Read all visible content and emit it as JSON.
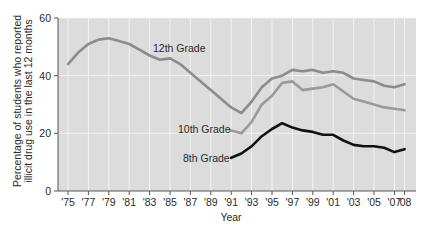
{
  "chart_data": {
    "type": "line",
    "title": "",
    "xlabel": "Year",
    "ylabel": "Percentage of students who reported illicit drug use in the last 12 months",
    "ylabel_lines": [
      "Percentage of students who reported",
      "illicit drug use in the last 12 months"
    ],
    "ylim": [
      0,
      60
    ],
    "yticks": [
      0,
      20,
      40,
      60
    ],
    "xlim": [
      1974,
      2008
    ],
    "xticks": [
      1975,
      1977,
      1979,
      1981,
      1983,
      1985,
      1987,
      1989,
      1991,
      1993,
      1995,
      1997,
      1999,
      2001,
      2003,
      2005,
      2007,
      2008
    ],
    "xtick_labels": [
      "'75",
      "'77",
      "'79",
      "'81",
      "'83",
      "'85",
      "'87",
      "'89",
      "'91",
      "'93",
      "'95",
      "'97",
      "'99",
      "'01",
      "'03",
      "'05",
      "'07",
      "'08"
    ],
    "grid": true,
    "legend": "inline labels",
    "series": [
      {
        "name": "12th Grade",
        "color": "#8c8c8c",
        "x": [
          1975,
          1976,
          1977,
          1978,
          1979,
          1980,
          1981,
          1982,
          1983,
          1984,
          1985,
          1986,
          1987,
          1988,
          1989,
          1990,
          1991,
          1992,
          1993,
          1994,
          1995,
          1996,
          1997,
          1998,
          1999,
          2000,
          2001,
          2002,
          2003,
          2004,
          2005,
          2006,
          2007,
          2008
        ],
        "values": [
          44,
          48,
          51,
          52.5,
          53,
          52,
          51,
          49,
          47,
          45.5,
          46,
          44,
          41,
          38,
          35,
          32,
          29,
          27,
          31,
          36,
          39,
          40,
          42,
          41.5,
          42,
          41,
          41.5,
          41,
          39,
          38.5,
          38,
          36.5,
          36,
          37
        ]
      },
      {
        "name": "10th Grade",
        "color": "#9a9a9a",
        "x": [
          1991,
          1992,
          1993,
          1994,
          1995,
          1996,
          1997,
          1998,
          1999,
          2000,
          2001,
          2002,
          2003,
          2004,
          2005,
          2006,
          2007,
          2008
        ],
        "values": [
          21,
          20,
          24,
          30,
          33,
          37.5,
          38,
          35,
          35.5,
          36,
          37,
          34.5,
          32,
          31,
          30,
          29,
          28.5,
          28
        ]
      },
      {
        "name": "8th Grade",
        "color": "#111111",
        "x": [
          1991,
          1992,
          1993,
          1994,
          1995,
          1996,
          1997,
          1998,
          1999,
          2000,
          2001,
          2002,
          2003,
          2004,
          2005,
          2006,
          2007,
          2008
        ],
        "values": [
          11.5,
          13,
          15.5,
          19,
          21.5,
          23.5,
          22,
          21,
          20.5,
          19.5,
          19.5,
          17.5,
          16,
          15.5,
          15.5,
          15,
          13.5,
          14.5
        ]
      }
    ],
    "annotations": [
      {
        "text": "12th Grade",
        "series": "12th Grade"
      },
      {
        "text": "10th Grade",
        "series": "10th Grade"
      },
      {
        "text": "8th Grade",
        "series": "8th Grade"
      }
    ]
  },
  "colors": {
    "plot_background": "#dcdcdc",
    "grid": "#f2f2f2",
    "axis": "#555555"
  }
}
